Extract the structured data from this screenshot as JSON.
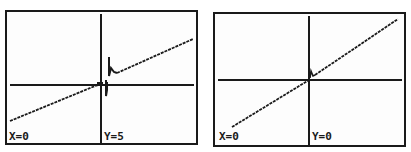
{
  "screens": [
    {
      "name": "left-graph",
      "x_label": "X=0",
      "y_label": "Y=5",
      "line_color": "#1a1a1a"
    },
    {
      "name": "right-graph",
      "x_label": "X=0",
      "y_label": "Y=0",
      "line_color": "#1a1a1a"
    }
  ]
}
